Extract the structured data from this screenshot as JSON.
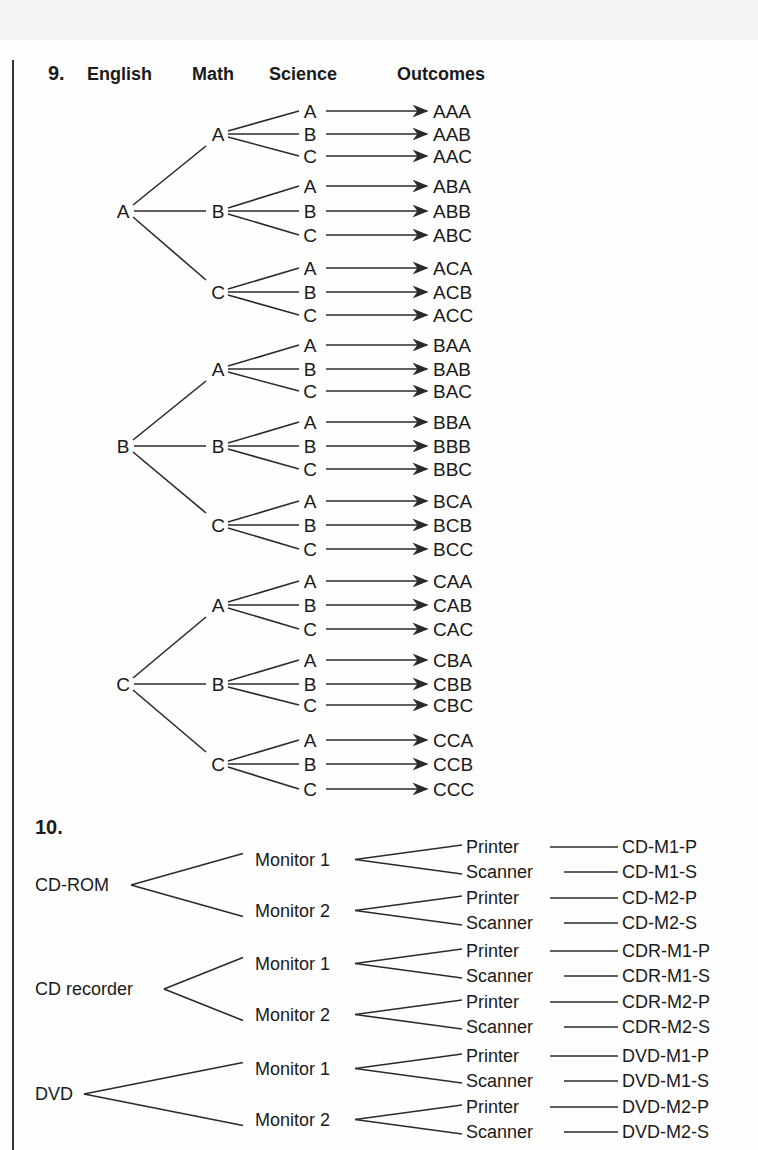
{
  "problem9": {
    "number": "9.",
    "headers": {
      "english": "English",
      "math": "Math",
      "science": "Science",
      "outcomes": "Outcomes"
    },
    "english": [
      "A",
      "B",
      "C"
    ],
    "math": [
      "A",
      "B",
      "C"
    ],
    "science": [
      "A",
      "B",
      "C"
    ],
    "outcomes": [
      "AAA",
      "AAB",
      "AAC",
      "ABA",
      "ABB",
      "ABC",
      "ACA",
      "ACB",
      "ACC",
      "BAA",
      "BAB",
      "BAC",
      "BBA",
      "BBB",
      "BBC",
      "BCA",
      "BCB",
      "BCC",
      "CAA",
      "CAB",
      "CAC",
      "CBA",
      "CBB",
      "CBC",
      "CCA",
      "CCB",
      "CCC"
    ]
  },
  "problem10": {
    "number": "10.",
    "drives": [
      "CD-ROM",
      "CD recorder",
      "DVD"
    ],
    "monitors": [
      "Monitor 1",
      "Monitor 2"
    ],
    "peripherals": [
      "Printer",
      "Scanner"
    ],
    "outcomes": [
      "CD-M1-P",
      "CD-M1-S",
      "CD-M2-P",
      "CD-M2-S",
      "CDR-M1-P",
      "CDR-M1-S",
      "CDR-M2-P",
      "CDR-M2-S",
      "DVD-M1-P",
      "DVD-M1-S",
      "DVD-M2-P",
      "DVD-M2-S"
    ]
  }
}
